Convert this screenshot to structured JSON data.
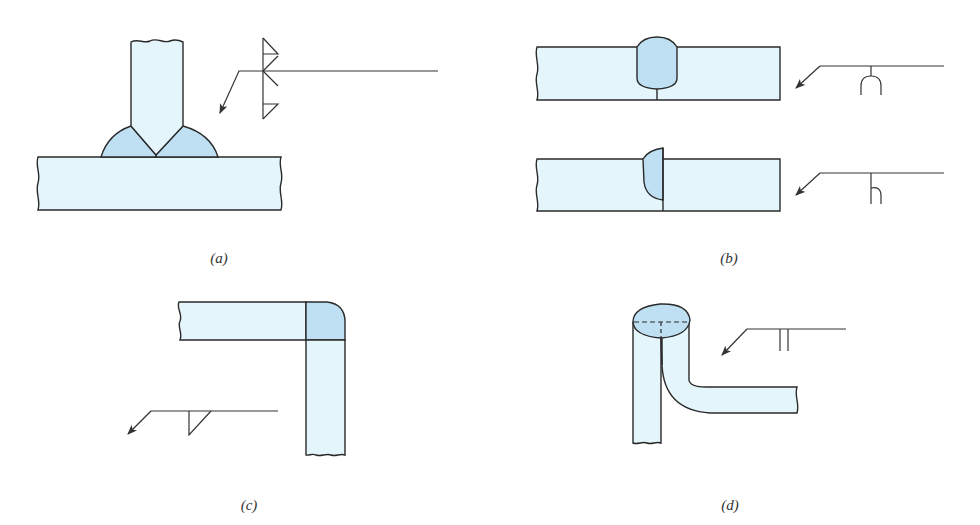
{
  "figure": {
    "colors": {
      "plate_fill": "#e4f5fb",
      "weld_fill": "#bfe0f3",
      "stroke": "#2a2a2a",
      "symbol_stroke": "#333333",
      "background": "#ffffff"
    },
    "panels": [
      {
        "id": "a",
        "label": "(a)",
        "description": "T-joint with double bevel-groove weld and fillet welds both sides"
      },
      {
        "id": "b",
        "label": "(b)",
        "description": "Butt joints with U-groove and J-groove welds"
      },
      {
        "id": "c",
        "label": "(c)",
        "description": "Corner joint with fillet weld"
      },
      {
        "id": "d",
        "label": "(d)",
        "description": "Edge/flare joint with flare weld symbol"
      }
    ]
  }
}
